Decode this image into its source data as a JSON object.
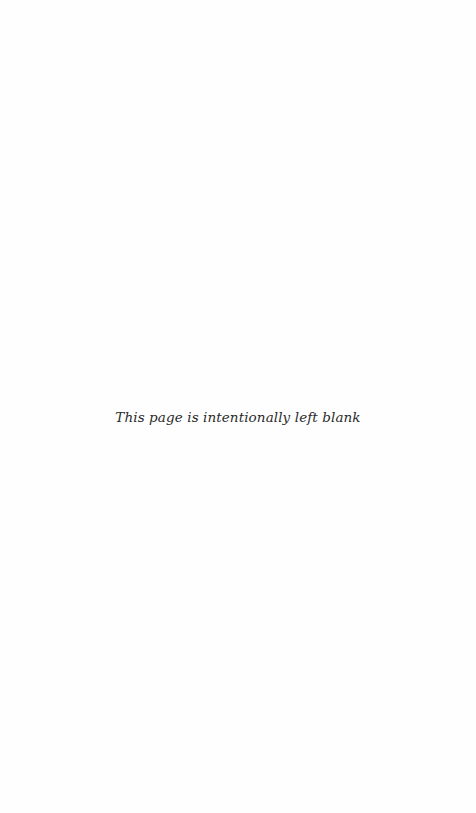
{
  "page": {
    "notice": "This page is intentionally left blank"
  }
}
